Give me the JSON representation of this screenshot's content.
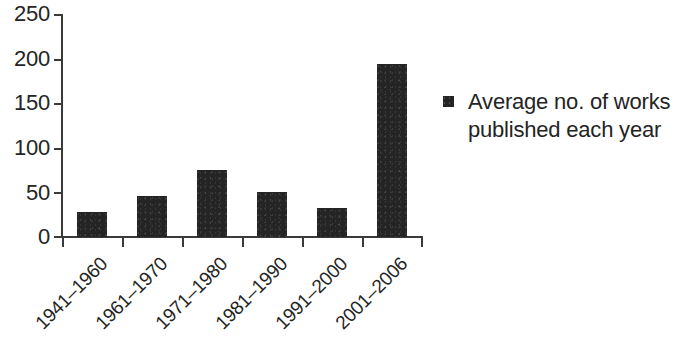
{
  "chart_data": {
    "type": "bar",
    "title": "",
    "xlabel": "",
    "ylabel": "",
    "categories": [
      "1941–1960",
      "1961–1970",
      "1971–1980",
      "1981–1990",
      "1991–2000",
      "2001–2006"
    ],
    "values": [
      28,
      46,
      75,
      50,
      32,
      194
    ],
    "series": [
      {
        "name": "Average no. of works published each year",
        "values": [
          28,
          46,
          75,
          50,
          32,
          194
        ]
      }
    ],
    "ylim": [
      0,
      250
    ],
    "yticks": [
      0,
      50,
      100,
      150,
      200,
      250
    ],
    "ytick_labels": [
      "0",
      "50",
      "100",
      "150",
      "200",
      "250"
    ],
    "grid": false,
    "legend_position": "right",
    "bar_color": "#242424",
    "axis_color": "#3a3a3a"
  },
  "legend": {
    "marker_name": "legend-swatch",
    "label_line1": "Average no. of works",
    "label_line2": "published each year",
    "label_full": "Average no. of works published each year"
  }
}
